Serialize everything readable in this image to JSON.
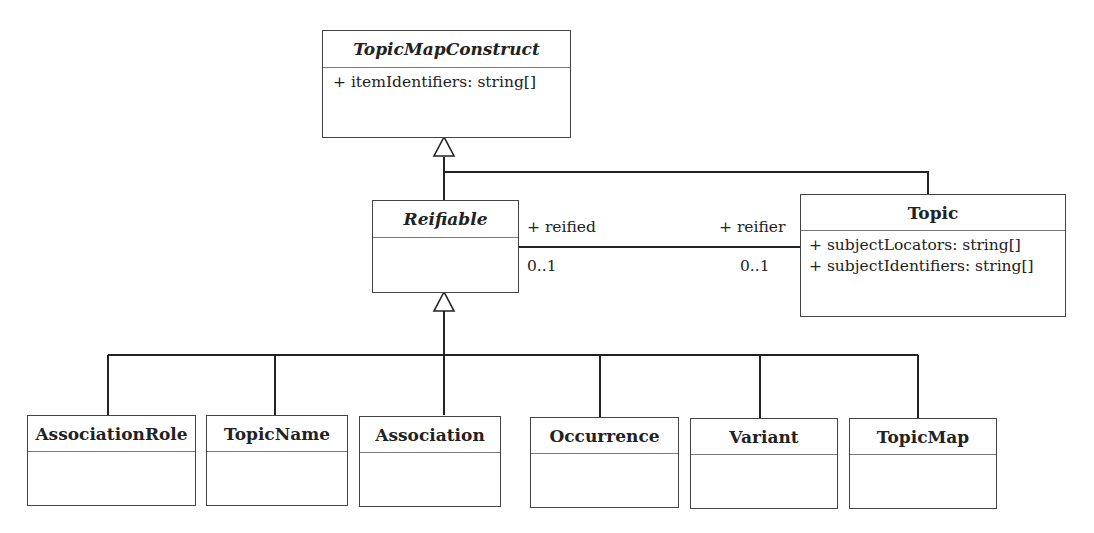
{
  "diagram": {
    "type": "UML class diagram",
    "classes": {
      "topic_map_construct": {
        "name": "TopicMapConstruct",
        "abstract": true,
        "attributes": [
          "+ itemIdentifiers: string[]"
        ]
      },
      "reifiable": {
        "name": "Reifiable",
        "abstract": true,
        "attributes": []
      },
      "topic": {
        "name": "Topic",
        "abstract": false,
        "attributes": [
          "+ subjectLocators: string[]",
          "+ subjectIdentifiers: string[]"
        ]
      },
      "association_role": {
        "name": "AssociationRole",
        "attributes": []
      },
      "topic_name": {
        "name": "TopicName",
        "attributes": []
      },
      "association": {
        "name": "Association",
        "attributes": []
      },
      "occurrence": {
        "name": "Occurrence",
        "attributes": []
      },
      "variant": {
        "name": "Variant",
        "attributes": []
      },
      "topic_map": {
        "name": "TopicMap",
        "attributes": []
      }
    },
    "association": {
      "left_role": "+ reified",
      "left_multiplicity": "0..1",
      "right_role": "+ reifier",
      "right_multiplicity": "0..1"
    },
    "generalizations": [
      {
        "child": "Reifiable",
        "parent": "TopicMapConstruct"
      },
      {
        "child": "Topic",
        "parent": "TopicMapConstruct"
      },
      {
        "child": "AssociationRole",
        "parent": "Reifiable"
      },
      {
        "child": "TopicName",
        "parent": "Reifiable"
      },
      {
        "child": "Association",
        "parent": "Reifiable"
      },
      {
        "child": "Occurrence",
        "parent": "Reifiable"
      },
      {
        "child": "Variant",
        "parent": "Reifiable"
      },
      {
        "child": "TopicMap",
        "parent": "Reifiable"
      }
    ]
  }
}
